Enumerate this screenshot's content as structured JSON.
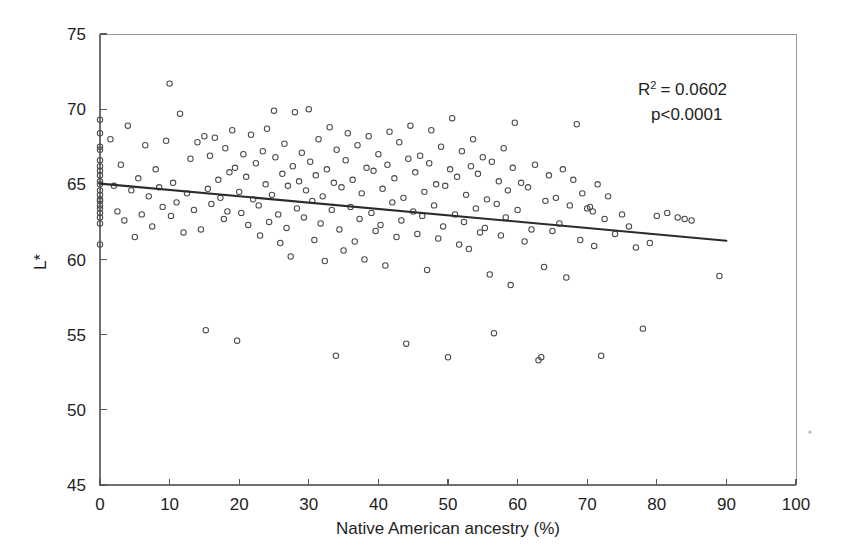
{
  "figure": {
    "background_color": "#ffffff",
    "frame_color": "#9a9a9a",
    "marker_color": "#4a4a4a",
    "trendline_color": "#2b2b2b",
    "text_color": "#1e1e1e"
  },
  "annotations": {
    "r_squared_prefix": "R",
    "r_squared_exponent": "2",
    "r_squared_value": "= 0.0602",
    "p_value": "p<0.0001"
  },
  "chart_data": {
    "type": "scatter",
    "title": "",
    "xlabel": "Native American ancestry (%)",
    "ylabel": "L*",
    "xlim": [
      0,
      100
    ],
    "ylim": [
      45,
      75
    ],
    "xticks": [
      0,
      10,
      20,
      30,
      40,
      50,
      60,
      70,
      80,
      90,
      100
    ],
    "yticks": [
      45,
      50,
      55,
      60,
      65,
      70,
      75
    ],
    "xtick_labels": [
      "0",
      "10",
      "20",
      "30",
      "40",
      "50",
      "60",
      "70",
      "80",
      "90",
      "100"
    ],
    "ytick_labels": [
      "45",
      "50",
      "55",
      "60",
      "65",
      "70",
      "75"
    ],
    "grid": false,
    "legend": null,
    "marker_shape": "open-circle",
    "marker_size": 5,
    "annotation_texts": [
      "R2 = 0.0602",
      "p<0.0001"
    ],
    "trendline": {
      "type": "linear-regression",
      "x_start": 0,
      "y_start": 65.05,
      "x_end": 90,
      "y_end": 61.25,
      "slope": -0.0422,
      "intercept": 65.05,
      "r_squared": 0.0602,
      "p_value": "<0.0001"
    },
    "points": [
      [
        0,
        69.3
      ],
      [
        0,
        68.4
      ],
      [
        0,
        67.5
      ],
      [
        0,
        67.3
      ],
      [
        0,
        66.6
      ],
      [
        0,
        66.2
      ],
      [
        0,
        65.9
      ],
      [
        0,
        65.6
      ],
      [
        0,
        65.0
      ],
      [
        0,
        64.6
      ],
      [
        0,
        64.3
      ],
      [
        0,
        63.9
      ],
      [
        0,
        63.6
      ],
      [
        0,
        63.4
      ],
      [
        0,
        63.1
      ],
      [
        0,
        62.8
      ],
      [
        0,
        62.4
      ],
      [
        0,
        61.0
      ],
      [
        0,
        65.2
      ],
      [
        0,
        64.0
      ],
      [
        1.5,
        68.0
      ],
      [
        2.0,
        64.9
      ],
      [
        2.5,
        63.2
      ],
      [
        3.0,
        66.3
      ],
      [
        3.5,
        62.6
      ],
      [
        4.0,
        68.9
      ],
      [
        4.5,
        64.6
      ],
      [
        5.0,
        61.5
      ],
      [
        5.5,
        65.4
      ],
      [
        6.0,
        63.0
      ],
      [
        6.5,
        67.6
      ],
      [
        7.0,
        64.2
      ],
      [
        7.5,
        62.2
      ],
      [
        8.0,
        66.0
      ],
      [
        8.5,
        64.8
      ],
      [
        9.0,
        63.5
      ],
      [
        9.5,
        67.9
      ],
      [
        10.0,
        71.7
      ],
      [
        10.2,
        62.9
      ],
      [
        10.5,
        65.1
      ],
      [
        11.0,
        63.8
      ],
      [
        11.5,
        69.7
      ],
      [
        12.0,
        61.8
      ],
      [
        12.5,
        64.4
      ],
      [
        13.0,
        66.7
      ],
      [
        13.5,
        63.3
      ],
      [
        14.0,
        67.8
      ],
      [
        14.5,
        62.0
      ],
      [
        15.0,
        68.2
      ],
      [
        15.2,
        55.3
      ],
      [
        15.5,
        64.7
      ],
      [
        15.8,
        66.9
      ],
      [
        16.0,
        63.7
      ],
      [
        16.5,
        68.1
      ],
      [
        17.0,
        65.3
      ],
      [
        17.3,
        64.1
      ],
      [
        17.8,
        62.7
      ],
      [
        18.0,
        67.4
      ],
      [
        18.3,
        63.2
      ],
      [
        18.6,
        65.8
      ],
      [
        19.0,
        68.6
      ],
      [
        19.4,
        66.1
      ],
      [
        19.7,
        54.6
      ],
      [
        20.0,
        64.5
      ],
      [
        20.3,
        63.1
      ],
      [
        20.6,
        67.0
      ],
      [
        21.0,
        65.5
      ],
      [
        21.3,
        62.3
      ],
      [
        21.7,
        68.3
      ],
      [
        22.0,
        64.0
      ],
      [
        22.4,
        66.4
      ],
      [
        22.8,
        63.6
      ],
      [
        23.0,
        61.6
      ],
      [
        23.4,
        67.2
      ],
      [
        23.8,
        65.0
      ],
      [
        24.0,
        68.7
      ],
      [
        24.3,
        62.5
      ],
      [
        24.7,
        64.3
      ],
      [
        25.0,
        69.9
      ],
      [
        25.2,
        66.8
      ],
      [
        25.6,
        63.0
      ],
      [
        25.9,
        61.1
      ],
      [
        26.2,
        65.7
      ],
      [
        26.5,
        67.7
      ],
      [
        26.8,
        62.1
      ],
      [
        27.0,
        64.9
      ],
      [
        27.4,
        60.2
      ],
      [
        27.7,
        66.2
      ],
      [
        28.0,
        69.8
      ],
      [
        28.3,
        63.4
      ],
      [
        28.6,
        65.2
      ],
      [
        29.0,
        67.1
      ],
      [
        29.3,
        62.8
      ],
      [
        29.6,
        64.6
      ],
      [
        30.0,
        70.0
      ],
      [
        30.2,
        66.5
      ],
      [
        30.5,
        63.9
      ],
      [
        30.8,
        61.3
      ],
      [
        31.0,
        65.6
      ],
      [
        31.4,
        68.0
      ],
      [
        31.7,
        62.4
      ],
      [
        32.0,
        64.2
      ],
      [
        32.3,
        59.9
      ],
      [
        32.6,
        66.0
      ],
      [
        33.0,
        68.8
      ],
      [
        33.3,
        63.3
      ],
      [
        33.6,
        65.1
      ],
      [
        33.9,
        53.6
      ],
      [
        34.0,
        67.3
      ],
      [
        34.4,
        62.0
      ],
      [
        34.7,
        64.8
      ],
      [
        35.0,
        60.6
      ],
      [
        35.3,
        66.6
      ],
      [
        35.6,
        68.4
      ],
      [
        36.0,
        63.5
      ],
      [
        36.3,
        65.3
      ],
      [
        36.6,
        61.2
      ],
      [
        37.0,
        67.6
      ],
      [
        37.3,
        62.7
      ],
      [
        37.6,
        64.4
      ],
      [
        38.0,
        60.0
      ],
      [
        38.3,
        66.1
      ],
      [
        38.6,
        68.2
      ],
      [
        39.0,
        63.1
      ],
      [
        39.3,
        65.9
      ],
      [
        39.6,
        61.9
      ],
      [
        40.0,
        67.0
      ],
      [
        40.3,
        62.3
      ],
      [
        40.6,
        64.7
      ],
      [
        41.0,
        59.6
      ],
      [
        41.3,
        66.3
      ],
      [
        41.6,
        68.5
      ],
      [
        42.0,
        63.8
      ],
      [
        42.3,
        65.4
      ],
      [
        42.6,
        61.5
      ],
      [
        43.0,
        67.8
      ],
      [
        43.3,
        62.6
      ],
      [
        43.6,
        64.1
      ],
      [
        44.0,
        54.4
      ],
      [
        44.3,
        66.7
      ],
      [
        44.6,
        68.9
      ],
      [
        45.0,
        63.2
      ],
      [
        45.3,
        65.8
      ],
      [
        45.6,
        61.7
      ],
      [
        46.0,
        66.9
      ],
      [
        46.3,
        62.9
      ],
      [
        46.6,
        64.5
      ],
      [
        47.0,
        59.3
      ],
      [
        47.3,
        66.4
      ],
      [
        47.6,
        68.6
      ],
      [
        48.0,
        63.6
      ],
      [
        48.3,
        65.0
      ],
      [
        48.6,
        61.4
      ],
      [
        49.0,
        67.5
      ],
      [
        49.3,
        62.2
      ],
      [
        49.6,
        64.9
      ],
      [
        50.0,
        53.5
      ],
      [
        50.3,
        66.0
      ],
      [
        50.6,
        69.4
      ],
      [
        51.0,
        63.0
      ],
      [
        51.3,
        65.5
      ],
      [
        51.6,
        61.0
      ],
      [
        52.0,
        67.2
      ],
      [
        52.3,
        62.5
      ],
      [
        52.6,
        64.3
      ],
      [
        53.0,
        60.7
      ],
      [
        53.3,
        66.2
      ],
      [
        53.6,
        68.0
      ],
      [
        54.0,
        63.4
      ],
      [
        54.3,
        65.7
      ],
      [
        54.6,
        61.8
      ],
      [
        55.0,
        66.8
      ],
      [
        55.3,
        62.1
      ],
      [
        55.6,
        64.0
      ],
      [
        56.0,
        59.0
      ],
      [
        56.3,
        66.5
      ],
      [
        56.6,
        55.1
      ],
      [
        57.0,
        63.7
      ],
      [
        57.3,
        65.2
      ],
      [
        57.6,
        61.6
      ],
      [
        58.0,
        67.4
      ],
      [
        58.3,
        62.8
      ],
      [
        58.6,
        64.6
      ],
      [
        59.0,
        58.3
      ],
      [
        59.3,
        66.1
      ],
      [
        59.6,
        69.1
      ],
      [
        60.0,
        63.3
      ],
      [
        60.5,
        65.1
      ],
      [
        61.0,
        61.2
      ],
      [
        61.5,
        64.8
      ],
      [
        62.0,
        62.0
      ],
      [
        62.5,
        66.3
      ],
      [
        63.0,
        53.3
      ],
      [
        63.4,
        53.5
      ],
      [
        63.8,
        59.5
      ],
      [
        64.0,
        63.9
      ],
      [
        64.5,
        65.6
      ],
      [
        65.0,
        61.9
      ],
      [
        65.5,
        64.1
      ],
      [
        66.0,
        62.4
      ],
      [
        66.5,
        66.0
      ],
      [
        67.0,
        58.8
      ],
      [
        67.5,
        63.6
      ],
      [
        68.0,
        65.3
      ],
      [
        68.5,
        69.0
      ],
      [
        69.0,
        61.3
      ],
      [
        69.3,
        64.4
      ],
      [
        70.0,
        63.4
      ],
      [
        70.4,
        63.5
      ],
      [
        70.8,
        63.2
      ],
      [
        71.0,
        60.9
      ],
      [
        71.5,
        65.0
      ],
      [
        72.0,
        53.6
      ],
      [
        72.5,
        62.7
      ],
      [
        73.0,
        64.2
      ],
      [
        74.0,
        61.7
      ],
      [
        75.0,
        63.0
      ],
      [
        76.0,
        62.2
      ],
      [
        77.0,
        60.8
      ],
      [
        78.0,
        55.4
      ],
      [
        79.0,
        61.1
      ],
      [
        80.0,
        62.9
      ],
      [
        81.5,
        63.1
      ],
      [
        83.0,
        62.8
      ],
      [
        84.0,
        62.7
      ],
      [
        85.0,
        62.6
      ],
      [
        89.0,
        58.9
      ]
    ]
  }
}
